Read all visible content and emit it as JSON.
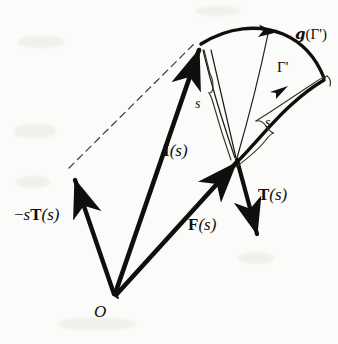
{
  "figure": {
    "background_color": "#fbfbf9",
    "ink_color": "#100f0d"
  },
  "labels": {
    "g_of_gamma": {
      "script": "g",
      "arg_open": "(",
      "gamma": "Γ",
      "prime": "'",
      "arg_close": ")"
    },
    "gamma": {
      "gamma": "Γ",
      "prime": "'"
    },
    "arclength_left": "s",
    "arclength_right": "s",
    "vector_I": {
      "symbol": "I",
      "arg": "(s)"
    },
    "vector_T": {
      "symbol": "T",
      "arg": "(s)"
    },
    "vector_F": {
      "symbol": "F",
      "arg": "(s)"
    },
    "vector_neg_sT": {
      "minus": "−",
      "scalar": "s",
      "symbol": "T",
      "arg": "(s)"
    },
    "origin": "O"
  },
  "geometry": {
    "origin_point": [
      115,
      295
    ],
    "vector_I_tip": [
      200,
      48
    ],
    "vector_F_tip": [
      238,
      161
    ],
    "vector_neg_sT_tip": [
      73,
      175
    ],
    "vector_T_start": [
      238,
      161
    ],
    "vector_T_tip": [
      259,
      241
    ],
    "dashed_parallelogram": true,
    "outer_arc_label": "g(Γ')",
    "inner_curve_label": "Γ'"
  }
}
